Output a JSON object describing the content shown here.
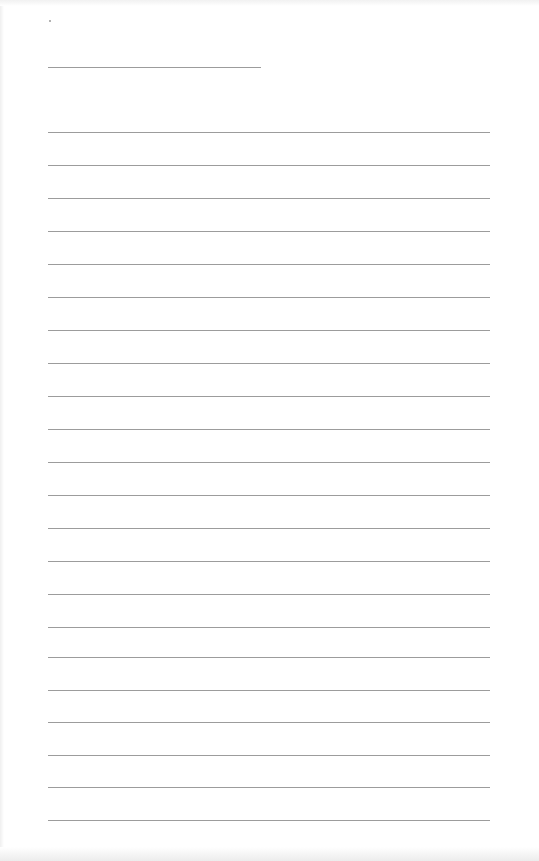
{
  "document": {
    "type": "lined-paper",
    "title_line": {
      "y": 67,
      "x_start": 48,
      "x_end": 261
    },
    "lines": {
      "count": 22,
      "x_start": 48,
      "x_end": 490,
      "y_positions": [
        132,
        165,
        198,
        231,
        264,
        297,
        330,
        363,
        396,
        429,
        462,
        495,
        528,
        561,
        594,
        627,
        657,
        690,
        722,
        755,
        787,
        820
      ]
    },
    "colors": {
      "paper": "#ffffff",
      "rule": "#9c9c9c"
    }
  }
}
